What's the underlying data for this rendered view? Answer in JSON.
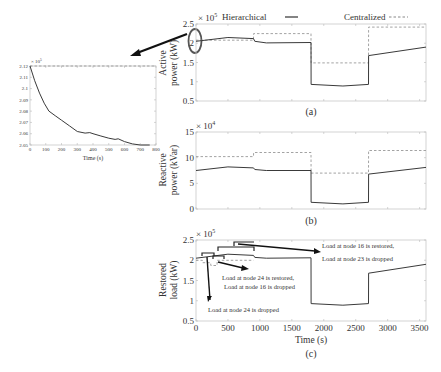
{
  "legend": {
    "hierarchical": "Hierarchical",
    "centralized": "Centralized"
  },
  "panels": {
    "a": {
      "label": "(a)",
      "ylabel_1": "Active",
      "ylabel_2": "power (kW)",
      "exponent": "× 10",
      "exp_power": "5"
    },
    "b": {
      "label": "(b)",
      "ylabel_1": "Reactive",
      "ylabel_2": "power (kVar)",
      "exponent": "× 10",
      "exp_power": "4"
    },
    "c": {
      "label": "(c)",
      "ylabel_1": "Restored",
      "ylabel_2": "load (kW)",
      "exponent": "× 10",
      "exp_power": "5",
      "xlabel": "Time (s)"
    },
    "inset": {
      "xlabel": "Time (s)",
      "exponent": "× 10",
      "exp_power": "5"
    }
  },
  "annotations": {
    "node24_dropped": "Load at node 24 is dropped",
    "node24_restored": "Load at node 24 is restored,",
    "node16_dropped": "Load at node 16 is dropped",
    "node16_restored": "Load at node 16 is restored,",
    "node23_dropped": "Load at node 23 is dropped"
  },
  "chart_data": [
    {
      "type": "line",
      "title": "(a)",
      "xlabel": "",
      "ylabel": "Active power (kW)",
      "y_scale": "x 10^5",
      "xlim": [
        0,
        3600
      ],
      "ylim": [
        0.5,
        2.5
      ],
      "yticks": [
        "0.5",
        "1",
        "1.5",
        "2",
        "2.5"
      ],
      "series": [
        {
          "name": "Hierarchical",
          "style": "solid",
          "x": [
            0,
            500,
            900,
            920,
            1100,
            1800,
            1801,
            2300,
            2700,
            2701,
            3600
          ],
          "y": [
            2.05,
            2.15,
            2.12,
            2.05,
            2.01,
            2.02,
            0.93,
            0.89,
            0.93,
            1.68,
            1.9
          ]
        },
        {
          "name": "Centralized",
          "style": "dashed",
          "x": [
            0,
            900,
            901,
            1800,
            1801,
            2700,
            2701,
            3600
          ],
          "y": [
            2.08,
            2.08,
            2.25,
            2.25,
            1.49,
            1.49,
            2.42,
            2.42
          ]
        }
      ]
    },
    {
      "type": "line",
      "title": "(b)",
      "xlabel": "",
      "ylabel": "Reactive power (kVar)",
      "y_scale": "x 10^4",
      "xlim": [
        0,
        3600
      ],
      "ylim": [
        0,
        15
      ],
      "yticks": [
        "0",
        "5",
        "10",
        "15"
      ],
      "series": [
        {
          "name": "Hierarchical",
          "style": "solid",
          "x": [
            0,
            500,
            900,
            920,
            1100,
            1800,
            1801,
            2300,
            2700,
            2701,
            3600
          ],
          "y": [
            7.5,
            8.2,
            8.0,
            7.7,
            7.5,
            7.5,
            1.3,
            1.0,
            1.3,
            6.8,
            8.1
          ]
        },
        {
          "name": "Centralized",
          "style": "dashed",
          "x": [
            0,
            900,
            901,
            1800,
            1801,
            2700,
            2701,
            3600
          ],
          "y": [
            10.2,
            10.2,
            11.0,
            11.0,
            7.0,
            7.0,
            11.4,
            11.4
          ]
        }
      ]
    },
    {
      "type": "line",
      "title": "(c)",
      "xlabel": "Time (s)",
      "ylabel": "Restored load (kW)",
      "y_scale": "x 10^5",
      "xlim": [
        0,
        3600
      ],
      "ylim": [
        0.5,
        2.5
      ],
      "xticks": [
        "0",
        "500",
        "1000",
        "1500",
        "2000",
        "2500",
        "3000",
        "3500"
      ],
      "yticks": [
        "0.5",
        "1",
        "1.5",
        "2",
        "2.5"
      ],
      "series": [
        {
          "name": "Hierarchical",
          "style": "solid",
          "x": [
            0,
            500,
            900,
            920,
            1100,
            1800,
            1801,
            2300,
            2700,
            2701,
            3600
          ],
          "y": [
            2.05,
            2.15,
            2.12,
            2.07,
            2.05,
            2.06,
            0.93,
            0.89,
            0.93,
            1.68,
            1.9
          ]
        },
        {
          "name": "Centralized",
          "style": "dashed",
          "x": [
            0,
            100,
            101,
            230,
            231,
            330,
            331,
            900
          ],
          "y": [
            2.0,
            2.0,
            1.94,
            1.94,
            1.87,
            1.87,
            2.0,
            2.0
          ]
        }
      ]
    },
    {
      "type": "line",
      "title": "Inset (zoom of initial active power)",
      "xlabel": "Time (s)",
      "ylabel": "",
      "y_scale": "x 10^5",
      "xlim": [
        0,
        800
      ],
      "ylim": [
        2.05,
        2.12
      ],
      "xticks": [
        "0",
        "100",
        "200",
        "300",
        "400",
        "500",
        "600",
        "700",
        "800"
      ],
      "yticks": [
        "2.05",
        "2.06",
        "2.07",
        "2.08",
        "2.09",
        "2.1",
        "2.11",
        "2.12"
      ],
      "series": [
        {
          "name": "Hierarchical",
          "style": "solid",
          "x": [
            0,
            30,
            60,
            90,
            120,
            160,
            200,
            250,
            300,
            350,
            380,
            400,
            450,
            500,
            540,
            560,
            600,
            650,
            700,
            760
          ],
          "y": [
            2.12,
            2.107,
            2.096,
            2.087,
            2.08,
            2.076,
            2.072,
            2.067,
            2.062,
            2.0605,
            2.061,
            2.06,
            2.058,
            2.056,
            2.055,
            2.0555,
            2.053,
            2.051,
            2.05,
            2.05
          ]
        },
        {
          "name": "Centralized",
          "style": "dashed",
          "x": [
            0,
            800
          ],
          "y": [
            2.12,
            2.12
          ]
        }
      ]
    }
  ]
}
